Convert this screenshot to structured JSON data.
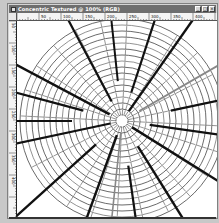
{
  "window": {
    "title": "Concentric Textured @ 100% (RGB)",
    "controls": [
      {
        "name": "minimize",
        "glyph": "_"
      },
      {
        "name": "maximize",
        "glyph": "□"
      },
      {
        "name": "close",
        "glyph": "×"
      }
    ]
  },
  "rulers": {
    "horizontal_labels": [
      "50",
      "100",
      "150",
      "200",
      "250",
      "300",
      "350",
      "400"
    ],
    "vertical_labels": [
      "50",
      "100",
      "150",
      "200",
      "250",
      "300",
      "350",
      "400"
    ]
  },
  "artwork": {
    "center": [
      105,
      100
    ],
    "inner_radius": 6,
    "ring_count": 16,
    "ring_spacing": 6,
    "ring_color": "#444444",
    "spokes": [
      {
        "angle": -118,
        "start": 22,
        "color": "#111111",
        "width": 2.2
      },
      {
        "angle": -96,
        "start": 40,
        "color": "#111111",
        "width": 2.0
      },
      {
        "angle": -72,
        "start": 30,
        "color": "#111111",
        "width": 2.2
      },
      {
        "angle": -55,
        "start": 12,
        "color": "#111111",
        "width": 2.4
      },
      {
        "angle": -30,
        "start": 20,
        "color": "#888888",
        "width": 1.8
      },
      {
        "angle": -12,
        "start": 50,
        "color": "#111111",
        "width": 2.2
      },
      {
        "angle": 8,
        "start": 28,
        "color": "#111111",
        "width": 2.4
      },
      {
        "angle": 32,
        "start": 12,
        "color": "#111111",
        "width": 2.4
      },
      {
        "angle": 58,
        "start": 30,
        "color": "#111111",
        "width": 2.4
      },
      {
        "angle": 82,
        "start": 45,
        "color": "#111111",
        "width": 2.2
      },
      {
        "angle": 96,
        "start": 12,
        "color": "#888888",
        "width": 1.6
      },
      {
        "angle": 110,
        "start": 15,
        "color": "#111111",
        "width": 2.4
      },
      {
        "angle": 138,
        "start": 35,
        "color": "#111111",
        "width": 2.4
      },
      {
        "angle": 168,
        "start": 12,
        "color": "#111111",
        "width": 2.2
      },
      {
        "angle": 180,
        "start": 50,
        "color": "#111111",
        "width": 2.2
      },
      {
        "angle": -152,
        "start": 14,
        "color": "#111111",
        "width": 2.4
      },
      {
        "angle": -165,
        "start": 40,
        "color": "#111111",
        "width": 2.2
      }
    ],
    "thin_spokes_count": 24,
    "thin_spoke_color": "#666666"
  }
}
